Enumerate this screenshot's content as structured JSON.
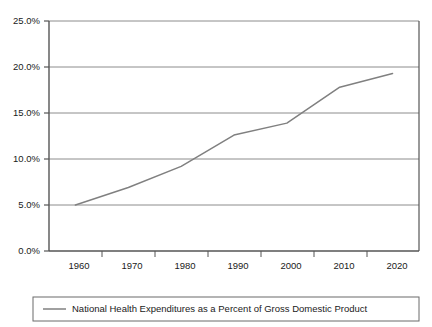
{
  "chart_data": {
    "type": "line",
    "title": "",
    "subtitle": "",
    "xlabel": "",
    "ylabel": "",
    "x": [
      1960,
      1970,
      1980,
      1990,
      2000,
      2010,
      2020
    ],
    "categories": [
      "1960",
      "1970",
      "1980",
      "1990",
      "2000",
      "2010",
      "2020"
    ],
    "series": [
      {
        "name": "National Health Expenditures as a Percent of Gross Domestic Product",
        "values": [
          5.0,
          6.9,
          9.2,
          12.6,
          13.9,
          17.8,
          19.3
        ],
        "color": "#808080"
      }
    ],
    "ylim": [
      0,
      25
    ],
    "ytick_values": [
      0,
      5,
      10,
      15,
      20,
      25
    ],
    "ytick_labels": [
      "0.0%",
      "5.0%",
      "10.0%",
      "15.0%",
      "20.0%",
      "25.0%"
    ],
    "xtick_labels": [
      "1960",
      "1970",
      "1980",
      "1990",
      "2000",
      "2010",
      "2020"
    ],
    "grid": "horizontal",
    "legend_position": "bottom",
    "legend_entries": [
      {
        "label": "National Health Expenditures as a Percent of Gross Domestic Product",
        "swatch": "line",
        "color": "#808080"
      }
    ],
    "colors": {
      "series_line": "#808080",
      "gridline": "#8c8c8c",
      "axis": "#555555",
      "plot_border": "#555555",
      "legend_border": "#6b6b6b",
      "background": "#ffffff",
      "text": "#1a1a1a"
    }
  }
}
